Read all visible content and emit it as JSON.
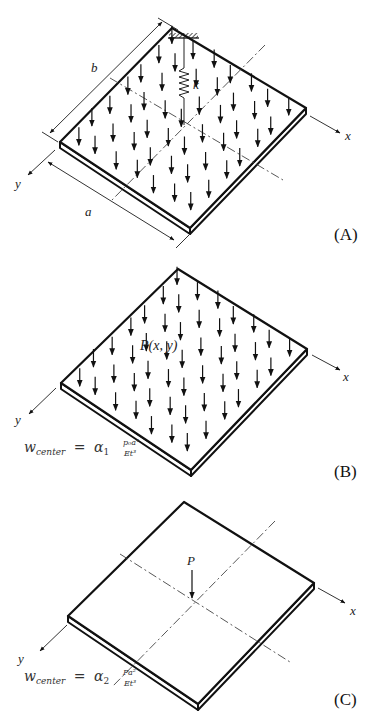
{
  "figure": {
    "panels": [
      {
        "id": "A",
        "label": "(A)",
        "description": "Rectangular plate under uniform distributed load with a spring support of stiffness k at the center",
        "axis_labels": {
          "x": "x",
          "y": "y"
        },
        "dimension_labels": {
          "length": "a",
          "width": "b"
        },
        "spring_label": "k"
      },
      {
        "id": "B",
        "label": "(B)",
        "description": "Rectangular plate under distributed load P(x, y)",
        "axis_labels": {
          "x": "x",
          "y": "y"
        },
        "load_label": "P(x, y)",
        "formula": {
          "lhs": "w",
          "lhs_sub": "center",
          "eq": "=",
          "coef": "α",
          "coef_sub": "1",
          "numerator": "p₀a⁴",
          "denominator": "Et³"
        }
      },
      {
        "id": "C",
        "label": "(C)",
        "description": "Rectangular plate under concentrated load P at the center",
        "axis_labels": {
          "x": "x",
          "y": "y"
        },
        "load_label": "P",
        "formula": {
          "lhs": "w",
          "lhs_sub": "center",
          "eq": "=",
          "coef": "α",
          "coef_sub": "2",
          "numerator": "Pa²",
          "denominator": "Et³"
        }
      }
    ]
  },
  "colors": {
    "background": "#ffffff",
    "stroke": "#111111"
  }
}
